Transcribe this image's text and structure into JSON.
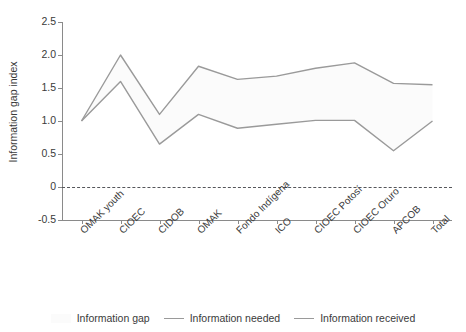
{
  "chart_data": {
    "type": "line",
    "title": "",
    "xlabel": "",
    "ylabel": "Information gap index",
    "ylim": [
      -0.5,
      2.5
    ],
    "yticks": [
      "2.5",
      "2.0",
      "1.5",
      "1.0",
      "0.5",
      "0",
      "-0.5"
    ],
    "ytick_values": [
      2.5,
      2.0,
      1.5,
      1.0,
      0.5,
      0,
      -0.5
    ],
    "grid": false,
    "legend_position": "bottom",
    "categories": [
      "OMAK youth",
      "CIOEC",
      "CIDOB",
      "OMAK",
      "Fondo Indígena",
      "ICO",
      "CIOEC Potosí",
      "CIOEC Oruro",
      "APCOB",
      "Total"
    ],
    "series": [
      {
        "name": "Information needed",
        "color": "#9a9a9a",
        "values": [
          1.0,
          2.0,
          1.1,
          1.83,
          1.63,
          1.68,
          1.8,
          1.88,
          1.57,
          1.55
        ]
      },
      {
        "name": "Information received",
        "color": "#9a9a9a",
        "values": [
          1.0,
          1.6,
          0.65,
          1.1,
          0.89,
          0.95,
          1.01,
          1.01,
          0.55,
          1.0
        ]
      }
    ],
    "band": {
      "name": "Information gap",
      "fill": "#fbfbfb",
      "upper_series": "Information needed",
      "lower_series": "Information received"
    },
    "reference_line": {
      "value": 0,
      "style": "dashed",
      "color": "#55565a"
    }
  },
  "legend": {
    "items": [
      {
        "label": "Information gap",
        "marker": "area-swatch"
      },
      {
        "label": "Information needed",
        "marker": "line-swatch"
      },
      {
        "label": "Information received",
        "marker": "line-swatch"
      }
    ]
  }
}
